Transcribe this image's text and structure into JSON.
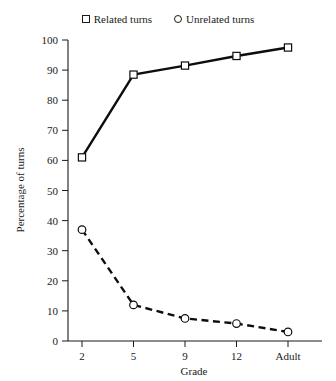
{
  "chart_data": {
    "type": "line",
    "title": "",
    "xlabel": "Grade",
    "ylabel": "Percentage of turns",
    "categories": [
      "2",
      "5",
      "9",
      "12",
      "Adult"
    ],
    "ylim": [
      0,
      100
    ],
    "yticks": [
      0,
      10,
      20,
      30,
      40,
      50,
      60,
      70,
      80,
      90,
      100
    ],
    "grid": false,
    "legend_position": "top-center",
    "series": [
      {
        "name": "Related turns",
        "marker": "open-square",
        "linestyle": "solid",
        "color": "#0d0d0d",
        "values": [
          61,
          88.5,
          91.5,
          94.7,
          97.5
        ]
      },
      {
        "name": "Unrelated turns",
        "marker": "open-circle",
        "linestyle": "dashed",
        "color": "#0d0d0d",
        "values": [
          37,
          12,
          7.5,
          5.8,
          3
        ]
      }
    ]
  },
  "legend": {
    "entries": [
      {
        "label": "Related turns",
        "marker": "square-marker-icon"
      },
      {
        "label": "Unrelated turns",
        "marker": "circle-marker-icon"
      }
    ]
  },
  "axes": {
    "y_title": "Percentage of turns",
    "x_title": "Grade",
    "y_tick_labels": [
      "100",
      "90",
      "80",
      "70",
      "60",
      "50",
      "40",
      "30",
      "20",
      "10",
      "0"
    ],
    "x_tick_labels": [
      "2",
      "5",
      "9",
      "12",
      "Adult"
    ]
  }
}
